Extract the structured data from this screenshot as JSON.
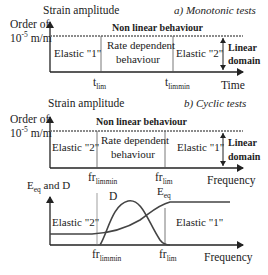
{
  "panel_a": {
    "title": "a) Monotonic tests",
    "y_label": "Strain amplitude",
    "y_order_line1": "Order of",
    "y_order_line2_base": "10",
    "y_order_line2_exp": "-5",
    "y_order_line2_unit": " m/m",
    "top_label": "Non linear behaviour",
    "regions": [
      "Elastic \"1\"",
      "Rate dependent",
      "behaviour",
      "Elastic \"2\""
    ],
    "linear_domain": [
      "Linear",
      "domain"
    ],
    "x_ticks": [
      {
        "base": "t",
        "sub": "lim"
      },
      {
        "base": "t",
        "sub": "limmin"
      }
    ],
    "x_label": "Time"
  },
  "panel_b": {
    "title": "b) Cyclic tests",
    "y_label": "Strain amplitude",
    "y_order_line1": "Order of",
    "y_order_line2_base": "10",
    "y_order_line2_exp": "-5",
    "y_order_line2_unit": " m/m",
    "top_label": "Non linear behaviour",
    "regions": [
      "Elastic \"2\"",
      "Rate dependent",
      "behaviour",
      "Elastic \"1\""
    ],
    "linear_domain": [
      "Linear",
      "domain"
    ],
    "x_ticks": [
      {
        "base": "fr",
        "sub": "limmin"
      },
      {
        "base": "fr",
        "sub": "lim"
      }
    ],
    "x_label": "Frequency"
  },
  "panel_c": {
    "y_label_base": "E",
    "y_label_sub": "eq",
    "y_label_rest": " and D",
    "curve_D_label": "D",
    "curve_Eeq_label_base": "E",
    "curve_Eeq_label_sub": "eq",
    "regions": [
      "Elastic \"2\"",
      "Elastic \"1\""
    ],
    "x_ticks": [
      {
        "base": "fr",
        "sub": "limmin"
      },
      {
        "base": "fr",
        "sub": "lim"
      }
    ],
    "x_label": "Frequency"
  },
  "colors": {
    "line": "#222222",
    "divider": "#555555",
    "dashed": "#666666",
    "curve": "#444444"
  }
}
